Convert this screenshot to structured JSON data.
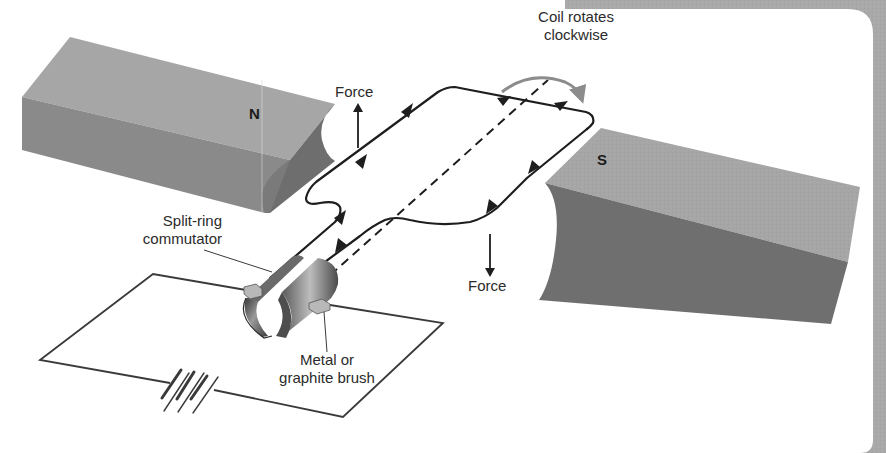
{
  "figure": {
    "colors": {
      "frame_gray": "#a9a9a9",
      "magnet_top": "#a6a6a6",
      "magnet_front": "#8a8a8a",
      "magnet_pole_face": "#6e6e6e",
      "s_magnet_front": "#6f6f6f",
      "wire": "#1e1e1e",
      "rotation_arrow": "#8c8c8c",
      "commutator": "#555555"
    }
  },
  "magnets": {
    "north": {
      "label": "N"
    },
    "south": {
      "label": "S"
    }
  },
  "labels": {
    "force_top": "Force",
    "force_bottom": "Force",
    "rotation_line1": "Coil rotates",
    "rotation_line2": "clockwise",
    "commutator_line1": "Split-ring",
    "commutator_line2": "commutator",
    "brush_line1": "Metal or",
    "brush_line2": "graphite brush"
  },
  "components": [
    "north-magnet",
    "south-magnet",
    "wire-coil",
    "rotation-axis",
    "split-ring-commutator",
    "brushes",
    "battery",
    "external-circuit"
  ]
}
